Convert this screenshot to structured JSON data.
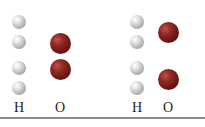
{
  "diagram": {
    "groups": [
      {
        "name": "left",
        "labels": {
          "h": "H",
          "o": "O"
        },
        "h_atoms": [
          {
            "x": 19,
            "y": 22
          },
          {
            "x": 19,
            "y": 42
          },
          {
            "x": 19,
            "y": 68
          },
          {
            "x": 19,
            "y": 88
          }
        ],
        "o_atoms": [
          {
            "x": 60,
            "y": 43
          },
          {
            "x": 60,
            "y": 69
          }
        ]
      },
      {
        "name": "right",
        "labels": {
          "h": "H",
          "o": "O"
        },
        "h_atoms": [
          {
            "x": 137,
            "y": 22
          },
          {
            "x": 137,
            "y": 42
          },
          {
            "x": 137,
            "y": 68
          },
          {
            "x": 137,
            "y": 88
          }
        ],
        "o_atoms": [
          {
            "x": 168,
            "y": 32
          },
          {
            "x": 168,
            "y": 79
          }
        ]
      }
    ],
    "colors": {
      "hydrogen": "#c0c0c0",
      "oxygen": "#7a1a14",
      "rule": "#8a8a8a"
    }
  }
}
